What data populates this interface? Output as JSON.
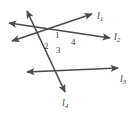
{
  "figure": {
    "background_color": "#ffffff",
    "stroke_color": "#4a4a4a",
    "text_color": "#3a3a3a",
    "stroke_width": 1.6,
    "width": 137,
    "height": 115
  },
  "lines": [
    {
      "id": "l1",
      "label": "l",
      "subscript": "1",
      "label_x": 97,
      "label_y": 11,
      "x1": 12,
      "y1": 41,
      "x2": 92,
      "y2": 14,
      "arrow_start": true,
      "arrow_end": true
    },
    {
      "id": "l2",
      "label": "l",
      "subscript": "2",
      "label_x": 114,
      "label_y": 32,
      "x1": 9,
      "y1": 23,
      "x2": 110,
      "y2": 38,
      "arrow_start": true,
      "arrow_end": true
    },
    {
      "id": "l3",
      "label": "l",
      "subscript": "3",
      "label_x": 120,
      "label_y": 74,
      "x1": 27,
      "y1": 72,
      "x2": 118,
      "y2": 68,
      "arrow_start": true,
      "arrow_end": true
    },
    {
      "id": "l4",
      "label": "l",
      "subscript": "4",
      "label_x": 62,
      "label_y": 98,
      "x1": 27,
      "y1": 11,
      "x2": 65,
      "y2": 92,
      "arrow_start": true,
      "arrow_end": true
    }
  ],
  "intersections": [
    {
      "id": "left-vertex",
      "x": 38,
      "y": 36
    },
    {
      "id": "right-vertex",
      "x": 76,
      "y": 46
    }
  ],
  "angles": [
    {
      "id": "angle-1",
      "label": "1",
      "x": 55,
      "y": 31
    },
    {
      "id": "angle-2",
      "label": "2",
      "x": 44,
      "y": 42
    },
    {
      "id": "angle-3",
      "label": "3",
      "x": 56,
      "y": 46
    },
    {
      "id": "angle-4",
      "label": "4",
      "x": 71,
      "y": 38
    }
  ]
}
